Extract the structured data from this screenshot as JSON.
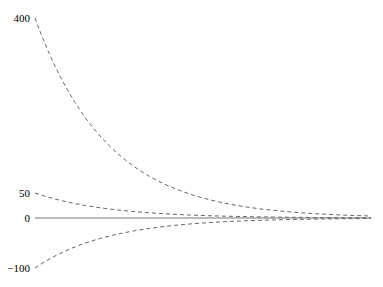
{
  "chart_data": {
    "type": "line",
    "title": "",
    "xlabel": "",
    "ylabel": "",
    "y_ticks": [
      400,
      50,
      0,
      -100
    ],
    "y_tick_labels": [
      "400",
      "50",
      "0",
      "−100"
    ],
    "ylim": [
      -100,
      400
    ],
    "grid": false,
    "legend": null,
    "x": [
      0,
      0.1,
      0.2,
      0.3,
      0.4,
      0.5,
      0.6,
      0.7,
      0.8,
      0.9,
      1.0
    ],
    "series": [
      {
        "name": "curve-400",
        "style": "dashed",
        "start": 400,
        "values": [
          400,
          253,
          160,
          101,
          64,
          40,
          26,
          16,
          10,
          6.5,
          4
        ]
      },
      {
        "name": "curve-50",
        "style": "dashed",
        "start": 50,
        "values": [
          50,
          32,
          20,
          12.6,
          8,
          5,
          3.2,
          2,
          1.3,
          0.8,
          0.5
        ]
      },
      {
        "name": "curve-neg100",
        "style": "dashed",
        "start": -100,
        "values": [
          -100,
          -63,
          -40,
          -25,
          -16,
          -10,
          -6.4,
          -4,
          -2.5,
          -1.6,
          -1
        ]
      },
      {
        "name": "zero-line",
        "style": "solid",
        "start": 0,
        "values": [
          0,
          0,
          0,
          0,
          0,
          0,
          0,
          0,
          0,
          0,
          0
        ]
      }
    ],
    "colors": {
      "dashed": "#555555",
      "solid": "#777777",
      "text": "#000000"
    }
  },
  "layout": {
    "x_start_px": 35,
    "x_end_px": 372,
    "zero_y_px": 218,
    "px_per_unit": 0.5,
    "decay_per_px": 0.0137
  }
}
